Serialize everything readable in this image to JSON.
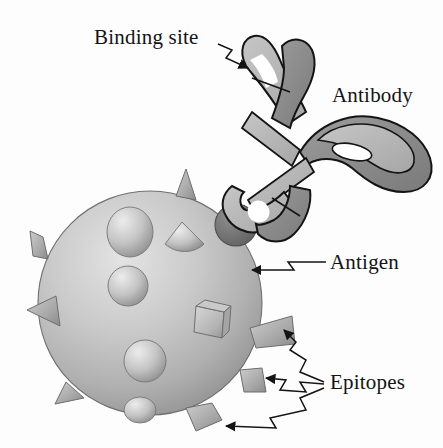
{
  "figure": {
    "domain": "biology-diagram",
    "background_color": "#fdfdfd",
    "line_color": "#141414"
  },
  "labels": {
    "binding_site": "Binding site",
    "antibody": "Antibody",
    "antigen": "Antigen",
    "epitopes": "Epitopes"
  },
  "palette": {
    "outline": "#141414",
    "antibody_light": "#b9b9b9",
    "antibody_mid": "#a2a2a2",
    "antibody_dark": "#7e7e7e",
    "antigen_light": "#d9d9d9",
    "antigen_mid": "#b2b2b2",
    "antigen_shadow": "#8d8d8d",
    "epitope_light": "#cfcfcf",
    "epitope_dark": "#8a8a8a",
    "bound_epitope": "#6f6f6f",
    "cleft_white": "#ffffff"
  },
  "antibody": {
    "shape": "Y-shaped immunoglobulin",
    "parts": [
      {
        "name": "upper-fab-arm",
        "state": "open binding cleft"
      },
      {
        "name": "lower-fab-arm",
        "state": "bound to epitope"
      },
      {
        "name": "fc-region",
        "state": "looped tail with open lens hole"
      }
    ]
  },
  "antigen": {
    "shape": "shaded sphere",
    "epitope_count": 13,
    "epitope_kinds": [
      "cone-spike",
      "dome-bump",
      "cube-block",
      "cone-base"
    ]
  },
  "leaders": [
    {
      "name": "binding-site-leader",
      "style": "zigzag",
      "arrow": "solid",
      "targets": 1
    },
    {
      "name": "antigen-leader",
      "style": "zigzag",
      "arrow": "solid",
      "targets": 1
    },
    {
      "name": "epitopes-leader",
      "style": "zigzag-branching",
      "arrow": "solid",
      "targets": 3
    }
  ]
}
